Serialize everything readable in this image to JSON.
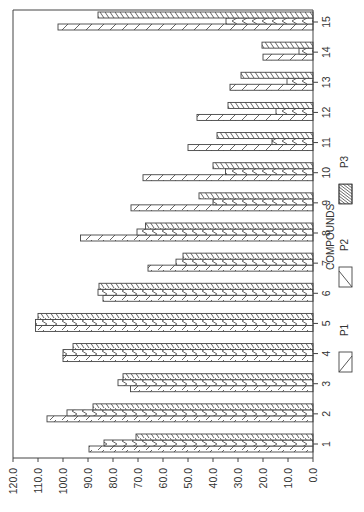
{
  "chart_data": {
    "type": "bar",
    "orientation_note": "rendered rotated 90 degrees: value axis along bottom (0 at right, 120 at left), categories along right edge (1 at bottom, 15 at top)",
    "title": "",
    "xlabel": "",
    "ylabel": "",
    "legend_title": "COMPOUNDS",
    "legend_position": "right",
    "grid": false,
    "ylim": [
      0,
      120
    ],
    "y_ticks": [
      "0.0",
      "10.0",
      "20.0",
      "30.0",
      "40.0",
      "50.0",
      "60.0",
      "70.0",
      "80.0",
      "90.0",
      "100.0",
      "110.0",
      "120.0"
    ],
    "categories": [
      "1",
      "2",
      "3",
      "4",
      "5",
      "6",
      "7",
      "8",
      "9",
      "10",
      "11",
      "12",
      "13",
      "14",
      "15"
    ],
    "series": [
      {
        "name": "P1",
        "pattern": "slash",
        "values": [
          89.6,
          106.4,
          73.0,
          100.0,
          111.0,
          84.0,
          66.0,
          93.0,
          72.8,
          68.0,
          50.0,
          46.4,
          33.2,
          20.0,
          102.0
        ]
      },
      {
        "name": "P2",
        "pattern": "chevron",
        "values": [
          83.6,
          98.4,
          78.0,
          100.0,
          111.0,
          86.0,
          54.8,
          70.4,
          40.0,
          35.0,
          16.4,
          14.8,
          10.4,
          5.6,
          34.8
        ]
      },
      {
        "name": "P3",
        "pattern": "backslash",
        "values": [
          70.8,
          88.0,
          76.0,
          96.0,
          110.0,
          85.6,
          52.0,
          67.0,
          45.6,
          40.0,
          38.4,
          34.0,
          28.8,
          20.4,
          86.0
        ]
      }
    ]
  },
  "colors": {
    "ink": "#444444",
    "background": "#ffffff"
  }
}
